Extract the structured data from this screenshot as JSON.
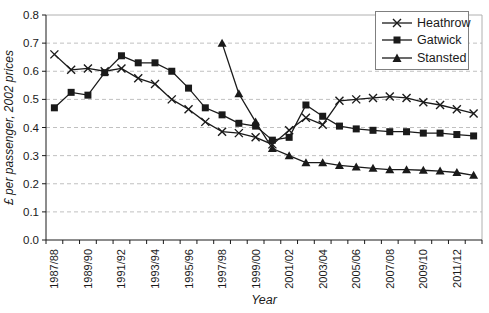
{
  "figure": {
    "width": 489,
    "height": 313
  },
  "chart_data": {
    "type": "line",
    "title": "",
    "xlabel": "Year",
    "ylabel": "£ per passenger, 2002 prices",
    "ylim": [
      0.0,
      0.8
    ],
    "ytick_step": 0.1,
    "yticks": [
      "0.0",
      "0.1",
      "0.2",
      "0.3",
      "0.4",
      "0.5",
      "0.6",
      "0.7",
      "0.8"
    ],
    "grid": "horizontal-dashed",
    "gridline_color": "#c0c0c0",
    "axis_color": "#1a1a1a",
    "frame_color": "#b0b0b0",
    "series_color": "#1a1a1a",
    "legend_position": "top-right",
    "xtick_label_every": 2,
    "categories": [
      "1987/88",
      "1988/89",
      "1989/90",
      "1990/91",
      "1991/92",
      "1992/93",
      "1993/94",
      "1994/95",
      "1995/96",
      "1996/97",
      "1997/98",
      "1998/99",
      "1999/00",
      "2000/01",
      "2001/02",
      "2002/03",
      "2003/04",
      "2004/05",
      "2005/06",
      "2006/07",
      "2007/08",
      "2008/09",
      "2009/10",
      "2010/11",
      "2011/12",
      "2012/13"
    ],
    "series": [
      {
        "name": "Heathrow",
        "marker": "x",
        "values": [
          0.66,
          0.605,
          0.61,
          0.6,
          0.61,
          0.575,
          0.555,
          0.5,
          0.465,
          0.42,
          0.385,
          0.38,
          0.365,
          0.34,
          0.39,
          0.435,
          0.41,
          0.495,
          0.5,
          0.505,
          0.51,
          0.505,
          0.49,
          0.48,
          0.465,
          0.45
        ]
      },
      {
        "name": "Gatwick",
        "marker": "square",
        "values": [
          0.47,
          0.525,
          0.515,
          0.595,
          0.655,
          0.63,
          0.63,
          0.6,
          0.54,
          0.47,
          0.445,
          0.415,
          0.405,
          0.355,
          0.365,
          0.48,
          0.44,
          0.405,
          0.395,
          0.39,
          0.385,
          0.385,
          0.38,
          0.38,
          0.375,
          0.37
        ]
      },
      {
        "name": "Stansted",
        "marker": "triangle",
        "values": [
          null,
          null,
          null,
          null,
          null,
          null,
          null,
          null,
          null,
          null,
          0.7,
          0.52,
          0.42,
          0.325,
          0.3,
          0.275,
          0.275,
          0.265,
          0.26,
          0.255,
          0.25,
          0.25,
          0.248,
          0.245,
          0.24,
          0.23
        ]
      }
    ]
  }
}
